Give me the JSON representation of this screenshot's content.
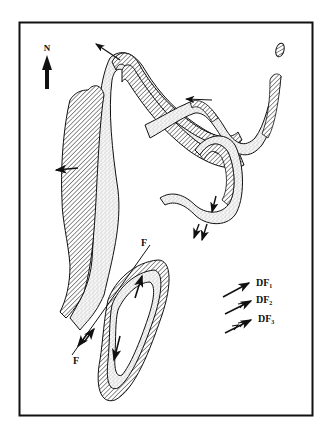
{
  "figure": {
    "type": "geological fold map",
    "north_label": "N",
    "fault_label_top": "F",
    "fault_label_bottom": "F",
    "legend": [
      {
        "symbol": "single-barb-arrow",
        "label": "DF",
        "sub": "1"
      },
      {
        "symbol": "double-barb-arrow",
        "label": "DF",
        "sub": "2"
      },
      {
        "symbol": "triple-barb-arrow",
        "label": "DF",
        "sub": "3"
      }
    ],
    "colors": {
      "line": "#111111",
      "stipple": "#bdbdbd",
      "background": "#ffffff"
    }
  }
}
